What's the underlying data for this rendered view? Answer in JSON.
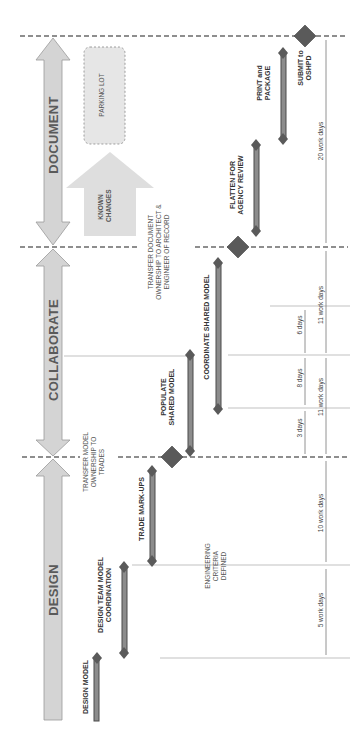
{
  "diagram": {
    "orientation": "rotated 90 degrees counter-clockwise",
    "phases": [
      {
        "label": "DESIGN"
      },
      {
        "label": "COLLABORATE"
      },
      {
        "label": "DOCUMENT"
      }
    ],
    "tasks": [
      {
        "label": "DESIGN MODEL"
      },
      {
        "label": "DESIGN TEAM MODEL COORDINATION"
      },
      {
        "label": "TRADE MARK-UPS"
      },
      {
        "label": "POPULATE SHARED MODEL"
      },
      {
        "label": "COORDINATE SHARED MODEL"
      },
      {
        "label": "FLATTEN FOR AGENCY REVIEW"
      },
      {
        "label": "PRINT and PACKAGE"
      }
    ],
    "milestones": [
      {
        "label": "TRANSFER MODEL OWNERSHIP TO TRADES"
      },
      {
        "label": "TRANSFER DOCUMENT OWNERSHIP TO ARCHITECT & ENGINEER OF RECORD"
      },
      {
        "label": "SUBMIT to OSHPD"
      }
    ],
    "notes": {
      "engineering": "ENGINEERING CRITERIA DEFINED",
      "known_changes": "KNOWN CHANGES",
      "parking_lot": "PARKING LOT"
    },
    "durations": {
      "d5": "5 work days",
      "d10": "10 work days",
      "d11a": "11 work days",
      "d11b": "11 work days",
      "d20": "20 work days",
      "d3": "3 days",
      "d8": "8 days",
      "d6": "6 days"
    },
    "colors": {
      "phase_arrow": "#d4d4d4",
      "phase_arrow_stroke": "#9a9a9a",
      "bar_fill": "#8c8c8c",
      "bar_stroke": "#4a4a4a",
      "diamond": "#5a5a5a",
      "dashed": "#6a6a6a",
      "guide": "#9a9a9a"
    }
  }
}
